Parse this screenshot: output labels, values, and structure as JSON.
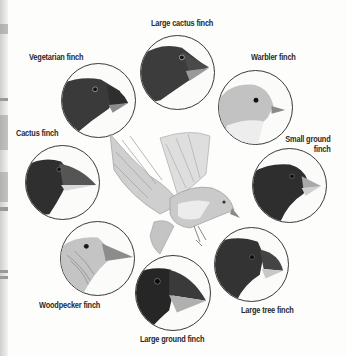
{
  "figure": {
    "type": "illustration",
    "central_bird": {
      "description": "flying finch, grayscale pencil illustration"
    },
    "finches": [
      {
        "id": "large-cactus-finch",
        "label": "Large cactus finch",
        "head_tone": "#3c3c3c",
        "beak": "large-pointed"
      },
      {
        "id": "vegetarian-finch",
        "label": "Vegetarian finch",
        "head_tone": "#3a3a3a",
        "beak": "short-curved"
      },
      {
        "id": "warbler-finch",
        "label": "Warbler finch",
        "head_tone": "#bdbdbd",
        "beak": "thin-pointed"
      },
      {
        "id": "small-ground-finch",
        "label_line1": "Small ground",
        "label_line2": "finch",
        "head_tone": "#2e2e2e",
        "beak": "small-conical"
      },
      {
        "id": "cactus-finch",
        "label": "Cactus finch",
        "head_tone": "#2f2f2f",
        "beak": "long-pointed"
      },
      {
        "id": "woodpecker-finch",
        "label": "Woodpecker finch",
        "head_tone": "#c4c4c4",
        "beak": "long-straight"
      },
      {
        "id": "large-ground-finch",
        "label": "Large ground finch",
        "head_tone": "#262626",
        "beak": "massive-conical"
      },
      {
        "id": "large-tree-finch",
        "label": "Large tree finch",
        "head_tone": "#333333",
        "beak": "curved-parrot-like"
      }
    ]
  }
}
